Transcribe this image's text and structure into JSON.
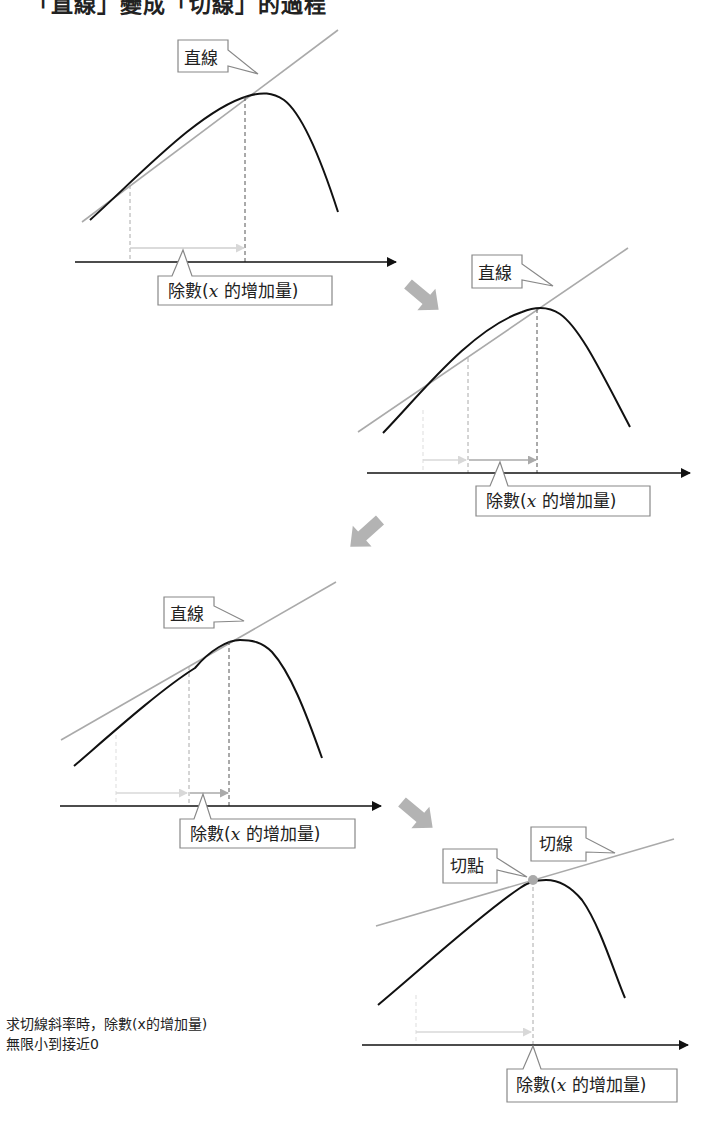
{
  "title": "「直線」變成「切線」的過程",
  "colors": {
    "curve": "#111111",
    "secant": "#aaaaaa",
    "axis": "#111111",
    "dashed": "#888888",
    "increment_arrow_light": "#d8d8d8",
    "increment_arrow": "#aaaaaa",
    "flow_arrow": "#b3b3b3",
    "callout_border": "#888888",
    "tangent_point": "#aaaaaa"
  },
  "diagrams": [
    {
      "id": "step-1",
      "line_label": "直線",
      "divisor_label_prefix": "除數(",
      "divisor_label_var": "x",
      "divisor_label_suffix": " 的增加量)"
    },
    {
      "id": "step-2",
      "line_label": "直線",
      "divisor_label_prefix": "除數(",
      "divisor_label_var": "x",
      "divisor_label_suffix": " 的增加量)"
    },
    {
      "id": "step-3",
      "line_label": "直線",
      "divisor_label_prefix": "除數(",
      "divisor_label_var": "x",
      "divisor_label_suffix": " 的增加量)"
    },
    {
      "id": "step-4",
      "line_label": "切線",
      "point_label": "切點",
      "divisor_label_prefix": "除數(",
      "divisor_label_var": "x",
      "divisor_label_suffix": " 的增加量)"
    }
  ],
  "note": {
    "line1": "求切線斜率時，除數(x的增加量)",
    "line2": "無限小到接近0"
  }
}
